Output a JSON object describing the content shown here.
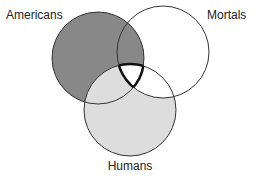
{
  "diagram": {
    "type": "venn",
    "sets": [
      {
        "id": "americans",
        "label": "Americans",
        "cx": 98,
        "cy": 58,
        "r": 46,
        "fill": "#888888"
      },
      {
        "id": "mortals",
        "label": "Mortals",
        "cx": 163,
        "cy": 52,
        "r": 46,
        "fill": "#ffffff"
      },
      {
        "id": "humans",
        "label": "Humans",
        "cx": 130,
        "cy": 110,
        "r": 46,
        "fill": "#dddddd"
      }
    ],
    "regions": {
      "americans_only": "#888888",
      "americans_mortals": "#888888",
      "americans_humans": "#dddddd",
      "humans_only": "#dddddd",
      "mortals_humans": "#ffffff",
      "mortals_only": "#ffffff",
      "all_three": "#ffffff"
    },
    "stroke": "#333333"
  }
}
